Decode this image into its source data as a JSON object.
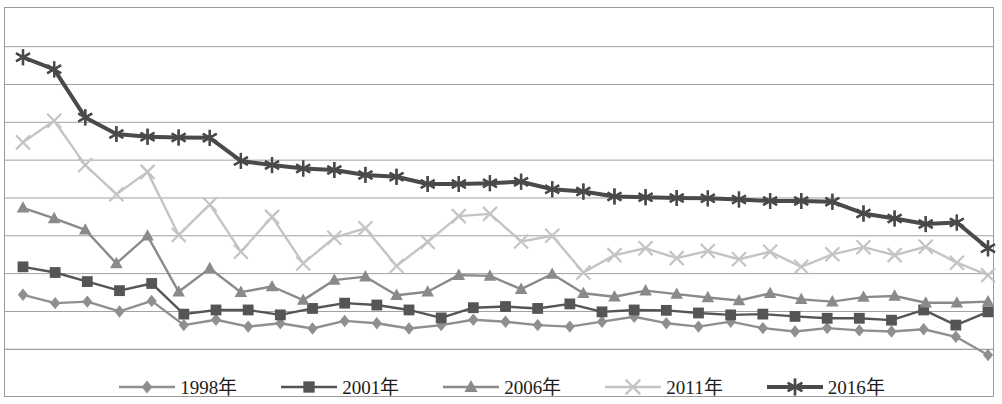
{
  "chart_data": {
    "type": "line",
    "title": "",
    "subtitle": "",
    "xlabel": "",
    "ylabel": "",
    "grid": true,
    "gridlines_y": [
      0,
      1,
      2,
      3,
      4,
      5,
      6,
      7,
      8
    ],
    "ylim": [
      0,
      8
    ],
    "y_tick_labels": [],
    "x_tick_labels": [],
    "xlim": [
      0,
      30
    ],
    "n_points": 31,
    "legend_position": "bottom-center",
    "axis_note": "Unlabeled y-axis; values expressed in gridline units where the bottom axis line = 0 and each horizontal gridline step = 1 (9 gridlines total, 0 through 8).",
    "series": [
      {
        "name": "1998年",
        "marker": "diamond",
        "color": "#8f8f8f",
        "line_width": 2.4,
        "values": [
          1.44,
          1.22,
          1.26,
          1.0,
          1.28,
          0.64,
          0.78,
          0.6,
          0.69,
          0.55,
          0.75,
          0.69,
          0.55,
          0.64,
          0.78,
          0.73,
          0.64,
          0.6,
          0.73,
          0.86,
          0.69,
          0.6,
          0.73,
          0.56,
          0.47,
          0.56,
          0.5,
          0.47,
          0.53,
          0.33,
          -0.15
        ]
      },
      {
        "name": "2001年",
        "marker": "square",
        "color": "#555555",
        "line_width": 2.4,
        "values": [
          2.18,
          2.03,
          1.79,
          1.55,
          1.74,
          0.93,
          1.04,
          1.04,
          0.91,
          1.08,
          1.22,
          1.17,
          1.04,
          0.83,
          1.1,
          1.13,
          1.08,
          1.2,
          0.99,
          1.04,
          1.03,
          0.96,
          0.91,
          0.93,
          0.87,
          0.82,
          0.82,
          0.77,
          1.04,
          0.64,
          0.99
        ]
      },
      {
        "name": "2006年",
        "marker": "triangle",
        "color": "#8a8a8a",
        "line_width": 2.4,
        "values": [
          3.74,
          3.46,
          3.16,
          2.27,
          3.0,
          1.52,
          2.14,
          1.51,
          1.66,
          1.3,
          1.83,
          1.92,
          1.43,
          1.52,
          1.96,
          1.94,
          1.59,
          1.99,
          1.48,
          1.39,
          1.55,
          1.46,
          1.37,
          1.29,
          1.48,
          1.32,
          1.26,
          1.38,
          1.41,
          1.23,
          1.23,
          1.26
        ]
      },
      {
        "name": "2011年",
        "marker": "x",
        "color": "#c4c4c4",
        "line_width": 2.4,
        "values": [
          5.47,
          6.04,
          4.87,
          4.1,
          4.69,
          3.02,
          3.83,
          2.58,
          3.5,
          2.27,
          2.95,
          3.2,
          2.2,
          2.84,
          3.52,
          3.58,
          2.85,
          3.0,
          2.03,
          2.49,
          2.67,
          2.41,
          2.6,
          2.38,
          2.58,
          2.18,
          2.51,
          2.7,
          2.49,
          2.71,
          2.29,
          1.96
        ]
      },
      {
        "name": "2016年",
        "marker": "asterisk",
        "color": "#4a4a4a",
        "line_width": 4.0,
        "values": [
          7.72,
          7.4,
          6.13,
          5.69,
          5.62,
          5.6,
          5.59,
          4.98,
          4.87,
          4.78,
          4.74,
          4.61,
          4.56,
          4.37,
          4.37,
          4.39,
          4.43,
          4.23,
          4.17,
          4.04,
          4.02,
          4.0,
          3.99,
          3.96,
          3.92,
          3.92,
          3.9,
          3.59,
          3.46,
          3.31,
          3.35,
          2.67
        ]
      }
    ]
  },
  "legend": {
    "items": [
      {
        "label": "1998年",
        "marker": "diamond",
        "color": "#8f8f8f"
      },
      {
        "label": "2001年",
        "marker": "square",
        "color": "#555555"
      },
      {
        "label": "2006年",
        "marker": "triangle",
        "color": "#8a8a8a"
      },
      {
        "label": "2011年",
        "marker": "x",
        "color": "#c4c4c4"
      },
      {
        "label": "2016年",
        "marker": "asterisk",
        "color": "#4a4a4a"
      }
    ]
  },
  "style": {
    "background": "#ffffff",
    "grid_color": "#a0a0a0",
    "frame_color": "#9a9a9a"
  }
}
